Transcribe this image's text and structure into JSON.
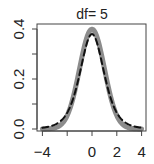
{
  "chart_data": {
    "type": "line",
    "title": "df= 5",
    "xlabel": "",
    "ylabel": "",
    "xlim": [
      -4.2,
      4.2
    ],
    "ylim": [
      0.0,
      0.42
    ],
    "x_ticks": [
      -4,
      -2,
      0,
      2,
      4
    ],
    "x_tick_labels": [
      "-4",
      "",
      "0",
      "2",
      "4"
    ],
    "y_ticks": [
      0.0,
      0.1,
      0.2,
      0.3,
      0.4
    ],
    "y_tick_labels": [
      "0.0",
      "",
      "0.2",
      "",
      "0.4"
    ],
    "grid": false,
    "legend": null,
    "series": [
      {
        "name": "Normal(0,1) density",
        "style": "solid",
        "color": "#8c8c8c",
        "width": 5,
        "x": [
          -4,
          -3.5,
          -3,
          -2.5,
          -2,
          -1.5,
          -1,
          -0.5,
          0,
          0.5,
          1,
          1.5,
          2,
          2.5,
          3,
          3.5,
          4
        ],
        "values": [
          0.0001,
          0.0009,
          0.0044,
          0.0175,
          0.054,
          0.1295,
          0.242,
          0.3521,
          0.3989,
          0.3521,
          0.242,
          0.1295,
          0.054,
          0.0175,
          0.0044,
          0.0009,
          0.0001
        ]
      },
      {
        "name": "t density (df=5)",
        "style": "dashed",
        "color": "#111111",
        "width": 2,
        "x": [
          -4,
          -3.5,
          -3,
          -2.5,
          -2,
          -1.5,
          -1,
          -0.5,
          0,
          0.5,
          1,
          1.5,
          2,
          2.5,
          3,
          3.5,
          4
        ],
        "values": [
          0.0051,
          0.0099,
          0.0173,
          0.0303,
          0.0651,
          0.1245,
          0.2197,
          0.3279,
          0.3796,
          0.3279,
          0.2197,
          0.1245,
          0.0651,
          0.0303,
          0.0173,
          0.0099,
          0.0051
        ]
      }
    ]
  }
}
